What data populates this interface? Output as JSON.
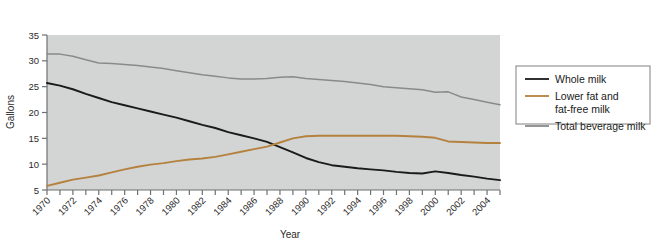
{
  "chart_data": {
    "type": "line",
    "title": "",
    "xlabel": "Year",
    "ylabel": "Gallons",
    "xlim": [
      1970,
      2005
    ],
    "ylim": [
      5,
      35
    ],
    "yticks": [
      5,
      10,
      15,
      20,
      25,
      30,
      35
    ],
    "ytick_labels": [
      "5",
      "10",
      "15",
      "20",
      "25",
      "30",
      "35"
    ],
    "xticks": [
      1970,
      1971,
      1972,
      1973,
      1974,
      1975,
      1976,
      1977,
      1978,
      1979,
      1980,
      1981,
      1982,
      1983,
      1984,
      1985,
      1986,
      1987,
      1988,
      1989,
      1990,
      1991,
      1992,
      1993,
      1994,
      1995,
      1996,
      1997,
      1998,
      1999,
      2000,
      2001,
      2002,
      2003,
      2004,
      2005
    ],
    "xtick_labels": [
      "1970",
      "1972",
      "1974",
      "1976",
      "1978",
      "1980",
      "1982",
      "1984",
      "1986",
      "1988",
      "1990",
      "1992",
      "1994",
      "1996",
      "1998",
      "2000",
      "2002",
      "2004"
    ],
    "xtick_label_values": [
      1970,
      1972,
      1974,
      1976,
      1978,
      1980,
      1982,
      1984,
      1986,
      1988,
      1990,
      1992,
      1994,
      1996,
      1998,
      2000,
      2002,
      2004
    ],
    "grid": false,
    "plot_background": "#d3d5d4",
    "legend_position": "right-outside",
    "x": [
      1970,
      1971,
      1972,
      1973,
      1974,
      1975,
      1976,
      1977,
      1978,
      1979,
      1980,
      1981,
      1982,
      1983,
      1984,
      1985,
      1986,
      1987,
      1988,
      1989,
      1990,
      1991,
      1992,
      1993,
      1994,
      1995,
      1996,
      1997,
      1998,
      1999,
      2000,
      2001,
      2002,
      2003,
      2004,
      2005
    ],
    "series": [
      {
        "name": "Whole milk",
        "color": "#1a1a1a",
        "values": [
          25.7,
          25.2,
          24.5,
          23.6,
          22.8,
          22.0,
          21.4,
          20.8,
          20.2,
          19.6,
          19.0,
          18.3,
          17.6,
          17.0,
          16.2,
          15.6,
          15.0,
          14.3,
          13.3,
          12.3,
          11.2,
          10.4,
          9.8,
          9.5,
          9.2,
          9.0,
          8.8,
          8.5,
          8.3,
          8.2,
          8.6,
          8.3,
          7.9,
          7.6,
          7.2,
          6.9
        ]
      },
      {
        "name": "Lower fat and fat-free milk",
        "color": "#b5813f",
        "values": [
          5.8,
          6.4,
          7.0,
          7.4,
          7.8,
          8.4,
          9.0,
          9.5,
          9.9,
          10.2,
          10.6,
          10.9,
          11.1,
          11.4,
          11.9,
          12.4,
          12.9,
          13.4,
          14.2,
          15.0,
          15.4,
          15.5,
          15.5,
          15.5,
          15.5,
          15.5,
          15.5,
          15.5,
          15.4,
          15.3,
          15.1,
          14.4,
          14.3,
          14.2,
          14.1,
          14.1
        ]
      },
      {
        "name": "Total beverage milk",
        "color": "#888b8c",
        "values": [
          31.3,
          31.3,
          30.9,
          30.2,
          29.6,
          29.5,
          29.3,
          29.1,
          28.8,
          28.5,
          28.1,
          27.7,
          27.3,
          27.0,
          26.7,
          26.5,
          26.5,
          26.6,
          26.8,
          26.9,
          26.6,
          26.4,
          26.2,
          26.0,
          25.7,
          25.4,
          25.0,
          24.8,
          24.6,
          24.4,
          23.9,
          24.0,
          23.0,
          22.5,
          22.0,
          21.5
        ]
      }
    ]
  },
  "legend": {
    "entries": [
      {
        "label": "Whole milk",
        "label2": "",
        "color": "#1a1a1a"
      },
      {
        "label": "Lower fat and",
        "label2": "fat-free milk",
        "color": "#b5813f"
      },
      {
        "label": "Total beverage milk",
        "label2": "",
        "color": "#888b8c"
      }
    ],
    "border_color": "#808080"
  }
}
